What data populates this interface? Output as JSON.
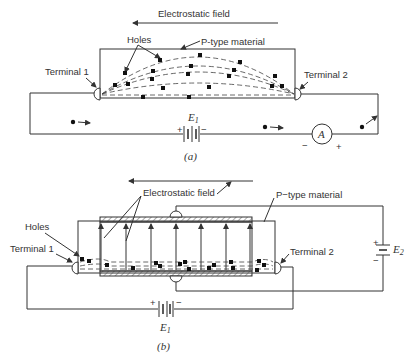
{
  "figure_a": {
    "caption": "(a)",
    "field_label": "Electrostatic field",
    "holes_label": "Holes",
    "material_label": "P-type material",
    "terminal1_label": "Terminal 1",
    "terminal2_label": "Terminal 2",
    "battery_label": "E",
    "battery_sub": "1",
    "battery_plus": "+",
    "battery_minus": "−",
    "ammeter_label": "A",
    "ammeter_minus": "−",
    "ammeter_plus": "+"
  },
  "figure_b": {
    "caption": "(b)",
    "field_label": "Electrostatic field",
    "holes_label": "Holes",
    "material_label": "P−type material",
    "terminal1_label": "Terminal 1",
    "terminal2_label": "Terminal 2",
    "battery1_label": "E",
    "battery1_sub": "1",
    "battery1_plus": "+",
    "battery1_minus": "−",
    "battery2_label": "E",
    "battery2_sub": "2",
    "battery2_plus": "+",
    "battery2_minus": "−"
  }
}
